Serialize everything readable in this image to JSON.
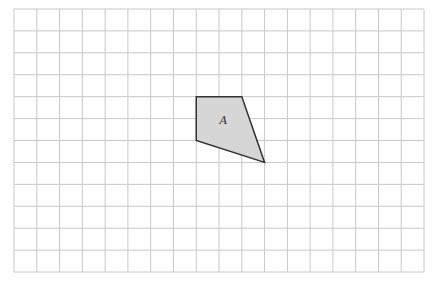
{
  "diagram": {
    "type": "grid-shape",
    "grid": {
      "columns": 18,
      "rows": 12,
      "origin_x": 14,
      "origin_y": 9,
      "cell_width": 22.78,
      "cell_height": 21.92,
      "line_color": "#c8c8c8"
    },
    "shape": {
      "label": "A",
      "fill": "#d6d6d6",
      "stroke": "#333333",
      "vertices_grid": [
        [
          8,
          4
        ],
        [
          10,
          4
        ],
        [
          11,
          7
        ],
        [
          8,
          6
        ]
      ]
    }
  }
}
